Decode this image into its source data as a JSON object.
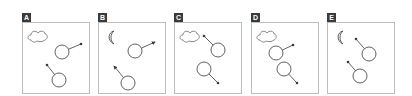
{
  "figure": {
    "stroke_color": "#3a3a3a",
    "label_bg": "#3a3a3a",
    "frame_color": "#bdbdbd",
    "panels": [
      {
        "label": "A",
        "left": 22,
        "weather": "cloud",
        "circles": [
          {
            "cx": 39,
            "cy": 29,
            "x2": 58,
            "y2": 21,
            "tip": "dot"
          },
          {
            "cx": 36,
            "cy": 57,
            "x2": 24,
            "y2": 42,
            "tip": "dot"
          }
        ]
      },
      {
        "label": "B",
        "left": 98,
        "weather": "moon",
        "circles": [
          {
            "cx": 36,
            "cy": 28,
            "x2": 56,
            "y2": 19,
            "tip": "arrow"
          },
          {
            "cx": 29,
            "cy": 60,
            "x2": 15,
            "y2": 43,
            "tip": "arrow"
          }
        ]
      },
      {
        "label": "C",
        "left": 174,
        "weather": "cloud",
        "circles": [
          {
            "cx": 43,
            "cy": 27,
            "x2": 29,
            "y2": 13,
            "tip": "dot"
          },
          {
            "cx": 29,
            "cy": 46,
            "x2": 43,
            "y2": 60,
            "tip": "dot"
          }
        ]
      },
      {
        "label": "D",
        "left": 251,
        "weather": "cloud",
        "circles": [
          {
            "cx": 24,
            "cy": 30,
            "x2": 41,
            "y2": 22,
            "tip": "dot"
          },
          {
            "cx": 32,
            "cy": 46,
            "x2": 45,
            "y2": 60,
            "tip": "dot"
          }
        ]
      },
      {
        "label": "E",
        "left": 327,
        "weather": "moon",
        "circles": [
          {
            "cx": 41,
            "cy": 31,
            "x2": 28,
            "y2": 16,
            "tip": "dot"
          },
          {
            "cx": 32,
            "cy": 53,
            "x2": 20,
            "y2": 39,
            "tip": "dot"
          }
        ]
      }
    ]
  }
}
